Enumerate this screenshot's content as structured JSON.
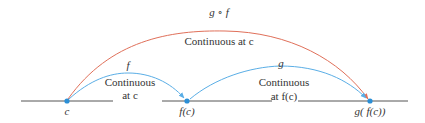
{
  "colors": {
    "axis": "#555555",
    "point": "#2b8fd6",
    "f_arc": "#5aaee6",
    "g_arc": "#5aaee6",
    "composite_arc": "#e0705a",
    "text": "#333333"
  },
  "points": [
    {
      "id": "c",
      "label": "c"
    },
    {
      "id": "fc",
      "label": "f(c)"
    },
    {
      "id": "gfc",
      "label": "g( f(c))"
    }
  ],
  "arcs": {
    "composite": {
      "name": "g ∘ f",
      "description": "Continuous at c"
    },
    "f": {
      "name": "f",
      "description_line1": "Continuous",
      "description_line2": "at c"
    },
    "g": {
      "name": "g",
      "description_line1": "Continuous",
      "description_line2": "at f(c)"
    }
  }
}
